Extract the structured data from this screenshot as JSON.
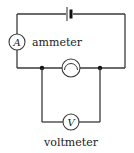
{
  "diagram": {
    "type": "circuit-diagram",
    "components": {
      "battery": {
        "name": "battery"
      },
      "ammeter": {
        "symbol": "A",
        "label": "ammeter"
      },
      "lamp": {
        "name": "lamp"
      },
      "voltmeter": {
        "symbol": "V",
        "label": "voltmeter"
      }
    },
    "colors": {
      "wire": "#3a3a3a",
      "text": "#222222",
      "background": "#ffffff"
    }
  }
}
